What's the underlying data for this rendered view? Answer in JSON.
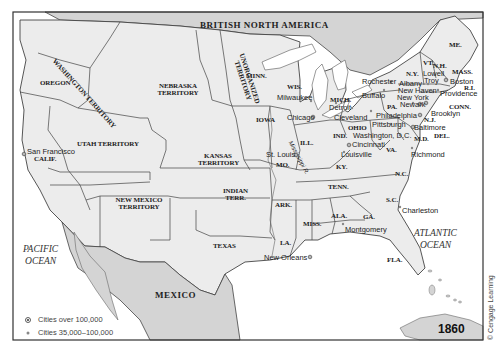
{
  "map": {
    "year": "1860",
    "credit": "© Cengage Learning",
    "colors": {
      "land": "#ececec",
      "foreign_land": "#d4d4d4",
      "water": "#ffffff",
      "border": "#444444",
      "frame": "#333333"
    },
    "regions": {
      "british_north_america": "BRITISH NORTH AMERICA",
      "mexico": "MEXICO",
      "washington": "WASHINGTON TERRITORY",
      "oregon": "OREGON",
      "nebraska": "NEBRASKA TERRITORY",
      "unorganized": "UNORGANIZED TERRITORY",
      "minn": "MINN.",
      "wis": "WIS.",
      "mich": "MICH.",
      "iowa": "IOWA",
      "ill": "ILL.",
      "ind": "IND.",
      "ohio": "OHIO",
      "utah": "UTAH TERRITORY",
      "calif": "CALIF.",
      "kansas": "KANSAS TERRITORY",
      "mo": "MO.",
      "ky": "KY.",
      "va": "VA.",
      "new_mexico": "NEW MEXICO TERRITORY",
      "indian": "INDIAN TERR.",
      "ark": "ARK.",
      "tenn": "TENN.",
      "nc": "N.C.",
      "sc": "S.C.",
      "texas": "TEXAS",
      "la": "LA.",
      "miss": "MISS.",
      "ala": "ALA.",
      "ga": "GA.",
      "fla": "FLA.",
      "me": "ME.",
      "vt": "VT.",
      "nh": "N.H.",
      "ny": "N.Y.",
      "mass": "MASS.",
      "ri": "R.I.",
      "conn": "CONN.",
      "pa": "PA.",
      "nj": "N.J.",
      "del": "DEL.",
      "md": "M.D."
    },
    "river": "Mississippi R.",
    "oceans": {
      "pacific": [
        "PACIFIC",
        "OCEAN"
      ],
      "atlantic": [
        "ATLANTIC",
        "OCEAN"
      ]
    },
    "cities": [
      {
        "name": "San Francisco",
        "size": "large"
      },
      {
        "name": "Milwaukee",
        "size": "medium"
      },
      {
        "name": "Chicago",
        "size": "large"
      },
      {
        "name": "St. Louis",
        "size": "large"
      },
      {
        "name": "Detroit",
        "size": "medium"
      },
      {
        "name": "Cleveland",
        "size": "medium"
      },
      {
        "name": "Cincinnati",
        "size": "large"
      },
      {
        "name": "Louisville",
        "size": "medium"
      },
      {
        "name": "Pittsburgh",
        "size": "medium"
      },
      {
        "name": "Washington, D.C.",
        "size": "medium"
      },
      {
        "name": "Rochester",
        "size": "medium"
      },
      {
        "name": "Buffalo",
        "size": "medium"
      },
      {
        "name": "Albany",
        "size": "medium"
      },
      {
        "name": "New Haven",
        "size": "medium"
      },
      {
        "name": "New York",
        "size": "large"
      },
      {
        "name": "Newark",
        "size": "medium"
      },
      {
        "name": "Brooklyn",
        "size": "large"
      },
      {
        "name": "Philadelphia",
        "size": "large"
      },
      {
        "name": "Baltimore",
        "size": "large"
      },
      {
        "name": "Richmond",
        "size": "medium"
      },
      {
        "name": "Lowell",
        "size": "medium"
      },
      {
        "name": "Troy",
        "size": "medium"
      },
      {
        "name": "Boston",
        "size": "large"
      },
      {
        "name": "Providence",
        "size": "medium"
      },
      {
        "name": "Charleston",
        "size": "medium"
      },
      {
        "name": "Montgomery",
        "size": "medium"
      },
      {
        "name": "New Orleans",
        "size": "large"
      }
    ],
    "legend": [
      {
        "symbol": "large-city-dot",
        "label": "Cities over 100,000"
      },
      {
        "symbol": "medium-city-dot",
        "label": "Cities 35,000–100,000"
      }
    ]
  }
}
